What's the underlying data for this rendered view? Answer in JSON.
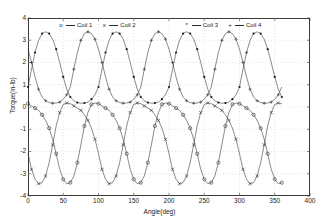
{
  "figure": {
    "background": "#ffffff",
    "axes_color": "#3a3a3a",
    "line_color": "#2a2a2a",
    "grid": "dotted-light"
  },
  "axes": {
    "xlabel": "Angle(deg)",
    "ylabel": "Torque(in-lb)",
    "xticks": [
      "0",
      "50",
      "100",
      "150",
      "200",
      "250",
      "300",
      "350",
      "400"
    ],
    "yticks": [
      "4",
      "3",
      "2",
      "1",
      "0",
      "-1",
      "-2",
      "-3",
      "-4"
    ],
    "xlim": [
      0,
      400
    ],
    "ylim": [
      -4,
      4
    ]
  },
  "legend": {
    "items": [
      {
        "marker": "o",
        "label": "Coil 1"
      },
      {
        "marker": "x",
        "label": "Coil 2"
      },
      {
        "marker": "*",
        "label": "Coil 3"
      },
      {
        "marker": "+",
        "label": "Coil 4"
      }
    ]
  },
  "chart_data": {
    "type": "line",
    "title": "",
    "xlabel": "Angle(deg)",
    "ylabel": "Torque(in-lb)",
    "xlim": [
      0,
      400
    ],
    "ylim": [
      -4,
      4
    ],
    "grid": true,
    "legend_position": "top-inside",
    "x": [
      0,
      5,
      10,
      15,
      20,
      25,
      30,
      35,
      40,
      45,
      50,
      55,
      60,
      65,
      70,
      75,
      80,
      85,
      90,
      95,
      100,
      105,
      110,
      115,
      120,
      125,
      130,
      135,
      140,
      145,
      150,
      155,
      160,
      165,
      170,
      175,
      180,
      185,
      190,
      195,
      200,
      205,
      210,
      215,
      220,
      225,
      230,
      235,
      240,
      245,
      250,
      255,
      260,
      265,
      270,
      275,
      280,
      285,
      290,
      295,
      300,
      305,
      310,
      315,
      320,
      325,
      330,
      335,
      340,
      345,
      350,
      355,
      360
    ],
    "series": [
      {
        "name": "Coil 1",
        "marker": "o",
        "values": [
          0.15,
          0.05,
          -0.05,
          -0.15,
          -0.35,
          -0.6,
          -0.95,
          -1.45,
          -2.1,
          -2.8,
          -3.25,
          -3.45,
          -3.4,
          -3.1,
          -2.5,
          -1.7,
          -0.85,
          -0.25,
          0.12,
          0.18,
          0.15,
          0.05,
          -0.05,
          -0.15,
          -0.35,
          -0.6,
          -0.95,
          -1.45,
          -2.1,
          -2.8,
          -3.25,
          -3.45,
          -3.4,
          -3.1,
          -2.5,
          -1.7,
          -0.85,
          -0.25,
          0.12,
          0.18,
          0.15,
          0.05,
          -0.05,
          -0.15,
          -0.35,
          -0.6,
          -0.95,
          -1.45,
          -2.1,
          -2.8,
          -3.25,
          -3.45,
          -3.4,
          -3.1,
          -2.5,
          -1.7,
          -0.85,
          -0.25,
          0.12,
          0.18,
          0.15,
          0.05,
          -0.05,
          -0.15,
          -0.35,
          -0.6,
          -0.95,
          -1.45,
          -2.1,
          -2.8,
          -3.25,
          -3.45,
          -3.4
        ]
      },
      {
        "name": "Coil 2",
        "marker": "x",
        "values": [
          -2.1,
          -2.8,
          -3.25,
          -3.45,
          -3.4,
          -3.1,
          -2.5,
          -1.7,
          -0.85,
          -0.25,
          0.12,
          0.18,
          0.15,
          0.05,
          -0.05,
          -0.15,
          -0.35,
          -0.6,
          -0.95,
          -1.45,
          -2.1,
          -2.8,
          -3.25,
          -3.45,
          -3.4,
          -3.1,
          -2.5,
          -1.7,
          -0.85,
          -0.25,
          0.12,
          0.18,
          0.15,
          0.05,
          -0.05,
          -0.15,
          -0.35,
          -0.6,
          -0.95,
          -1.45,
          -2.1,
          -2.8,
          -3.25,
          -3.45,
          -3.4,
          -3.1,
          -2.5,
          -1.7,
          -0.85,
          -0.25,
          0.12,
          0.18,
          0.15,
          0.05,
          -0.05,
          -0.15,
          -0.35,
          -0.6,
          -0.95,
          -1.45,
          -2.1,
          -2.8,
          -3.25,
          -3.45,
          -3.4,
          -3.1,
          -2.5,
          -1.7,
          -0.85,
          -0.25,
          0.12,
          0.18,
          0.15
        ]
      },
      {
        "name": "Coil 3",
        "marker": "*",
        "values": [
          0.9,
          1.7,
          2.45,
          3.0,
          3.3,
          3.38,
          3.3,
          3.05,
          2.6,
          2.0,
          1.35,
          0.8,
          0.45,
          0.28,
          0.2,
          0.17,
          0.18,
          0.22,
          0.35,
          0.55,
          0.9,
          1.7,
          2.45,
          3.0,
          3.3,
          3.38,
          3.3,
          3.05,
          2.6,
          2.0,
          1.35,
          0.8,
          0.45,
          0.28,
          0.2,
          0.17,
          0.18,
          0.22,
          0.35,
          0.55,
          0.9,
          1.7,
          2.45,
          3.0,
          3.3,
          3.38,
          3.3,
          3.05,
          2.6,
          2.0,
          1.35,
          0.8,
          0.45,
          0.28,
          0.2,
          0.17,
          0.18,
          0.22,
          0.35,
          0.55,
          0.9,
          1.7,
          2.45,
          3.0,
          3.3,
          3.38,
          3.3,
          3.05,
          2.6,
          2.0,
          1.35,
          0.8,
          0.45
        ]
      },
      {
        "name": "Coil 4",
        "marker": "+",
        "values": [
          2.6,
          2.0,
          1.35,
          0.8,
          0.45,
          0.28,
          0.2,
          0.17,
          0.18,
          0.22,
          0.35,
          0.55,
          0.9,
          1.7,
          2.45,
          3.0,
          3.3,
          3.38,
          3.3,
          3.05,
          2.6,
          2.0,
          1.35,
          0.8,
          0.45,
          0.28,
          0.2,
          0.17,
          0.18,
          0.22,
          0.35,
          0.55,
          0.9,
          1.7,
          2.45,
          3.0,
          3.3,
          3.38,
          3.3,
          3.05,
          2.6,
          2.0,
          1.35,
          0.8,
          0.45,
          0.28,
          0.2,
          0.17,
          0.18,
          0.22,
          0.35,
          0.55,
          0.9,
          1.7,
          2.45,
          3.0,
          3.3,
          3.38,
          3.3,
          3.05,
          2.6,
          2.0,
          1.35,
          0.8,
          0.45,
          0.28,
          0.2,
          0.17,
          0.18,
          0.22,
          0.35,
          0.55,
          0.9
        ]
      }
    ]
  }
}
